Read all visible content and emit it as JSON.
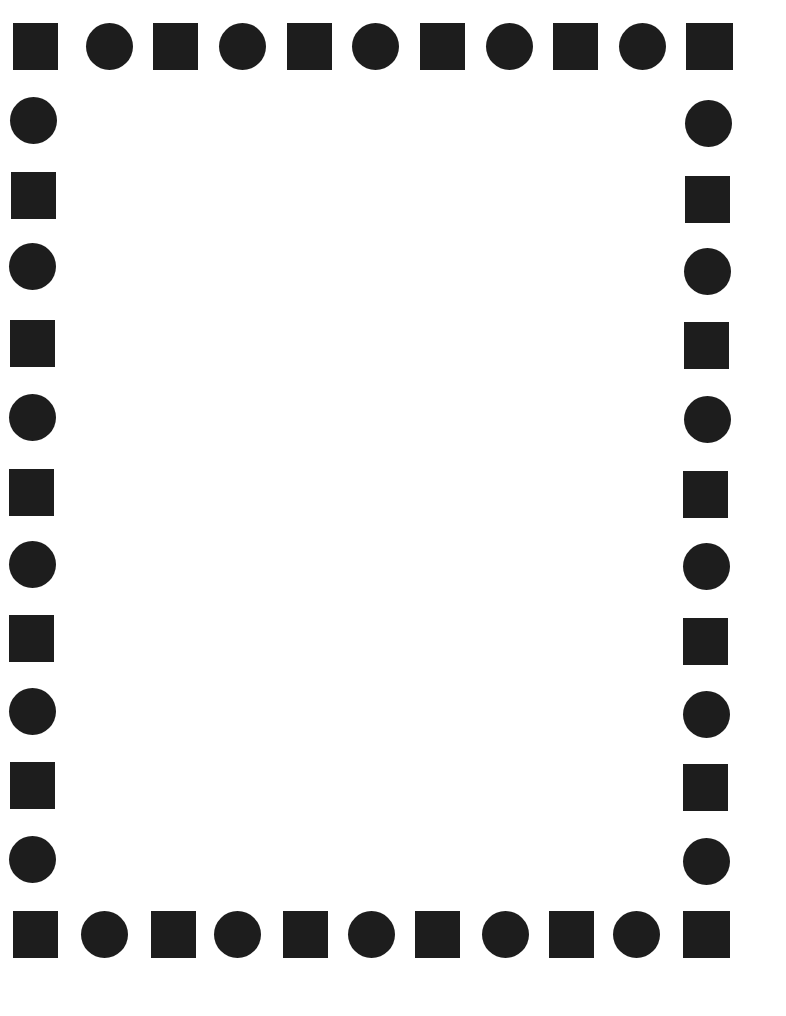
{
  "page": {
    "width": 786,
    "height": 1016,
    "background_color": "#ffffff",
    "shape_color": "#1d1d1d",
    "content_area_label": ""
  },
  "border": {
    "shape_size": 46,
    "pattern": [
      "square",
      "circle"
    ],
    "top_row": {
      "count": 11,
      "y": 23,
      "shapes": [
        {
          "type": "square",
          "x": 13,
          "y": 23,
          "w": 45,
          "h": 47
        },
        {
          "type": "circle",
          "x": 86,
          "y": 23,
          "w": 47,
          "h": 47
        },
        {
          "type": "square",
          "x": 153,
          "y": 23,
          "w": 45,
          "h": 47
        },
        {
          "type": "circle",
          "x": 219,
          "y": 23,
          "w": 47,
          "h": 47
        },
        {
          "type": "square",
          "x": 287,
          "y": 23,
          "w": 45,
          "h": 47
        },
        {
          "type": "circle",
          "x": 352,
          "y": 23,
          "w": 47,
          "h": 47
        },
        {
          "type": "square",
          "x": 420,
          "y": 23,
          "w": 45,
          "h": 47
        },
        {
          "type": "circle",
          "x": 486,
          "y": 23,
          "w": 47,
          "h": 47
        },
        {
          "type": "square",
          "x": 553,
          "y": 23,
          "w": 45,
          "h": 47
        },
        {
          "type": "circle",
          "x": 619,
          "y": 23,
          "w": 47,
          "h": 47
        },
        {
          "type": "square",
          "x": 686,
          "y": 23,
          "w": 47,
          "h": 47
        }
      ]
    },
    "bottom_row": {
      "count": 11,
      "y": 911,
      "shapes": [
        {
          "type": "square",
          "x": 13,
          "y": 911,
          "w": 45,
          "h": 47
        },
        {
          "type": "circle",
          "x": 81,
          "y": 911,
          "w": 47,
          "h": 47
        },
        {
          "type": "square",
          "x": 151,
          "y": 911,
          "w": 45,
          "h": 47
        },
        {
          "type": "circle",
          "x": 214,
          "y": 911,
          "w": 47,
          "h": 47
        },
        {
          "type": "square",
          "x": 283,
          "y": 911,
          "w": 45,
          "h": 47
        },
        {
          "type": "circle",
          "x": 348,
          "y": 911,
          "w": 47,
          "h": 47
        },
        {
          "type": "square",
          "x": 415,
          "y": 911,
          "w": 45,
          "h": 47
        },
        {
          "type": "circle",
          "x": 482,
          "y": 911,
          "w": 47,
          "h": 47
        },
        {
          "type": "square",
          "x": 549,
          "y": 911,
          "w": 45,
          "h": 47
        },
        {
          "type": "circle",
          "x": 613,
          "y": 911,
          "w": 47,
          "h": 47
        },
        {
          "type": "square",
          "x": 683,
          "y": 911,
          "w": 47,
          "h": 47
        }
      ]
    },
    "left_column": {
      "count": 13,
      "x": 13,
      "shapes": [
        {
          "type": "square",
          "x": 13,
          "y": 23,
          "w": 45,
          "h": 47
        },
        {
          "type": "circle",
          "x": 10,
          "y": 97,
          "w": 47,
          "h": 47
        },
        {
          "type": "square",
          "x": 11,
          "y": 172,
          "w": 45,
          "h": 47
        },
        {
          "type": "circle",
          "x": 9,
          "y": 243,
          "w": 47,
          "h": 47
        },
        {
          "type": "square",
          "x": 10,
          "y": 320,
          "w": 45,
          "h": 47
        },
        {
          "type": "circle",
          "x": 9,
          "y": 394,
          "w": 47,
          "h": 47
        },
        {
          "type": "square",
          "x": 9,
          "y": 469,
          "w": 45,
          "h": 47
        },
        {
          "type": "circle",
          "x": 9,
          "y": 541,
          "w": 47,
          "h": 47
        },
        {
          "type": "square",
          "x": 9,
          "y": 615,
          "w": 45,
          "h": 47
        },
        {
          "type": "circle",
          "x": 9,
          "y": 688,
          "w": 47,
          "h": 47
        },
        {
          "type": "square",
          "x": 10,
          "y": 762,
          "w": 45,
          "h": 47
        },
        {
          "type": "circle",
          "x": 9,
          "y": 836,
          "w": 47,
          "h": 47
        },
        {
          "type": "square",
          "x": 13,
          "y": 911,
          "w": 45,
          "h": 47
        }
      ]
    },
    "right_column": {
      "count": 13,
      "x": 686,
      "shapes": [
        {
          "type": "square",
          "x": 686,
          "y": 23,
          "w": 47,
          "h": 47
        },
        {
          "type": "circle",
          "x": 685,
          "y": 100,
          "w": 47,
          "h": 47
        },
        {
          "type": "square",
          "x": 685,
          "y": 176,
          "w": 45,
          "h": 47
        },
        {
          "type": "circle",
          "x": 684,
          "y": 248,
          "w": 47,
          "h": 47
        },
        {
          "type": "square",
          "x": 684,
          "y": 322,
          "w": 45,
          "h": 47
        },
        {
          "type": "circle",
          "x": 684,
          "y": 396,
          "w": 47,
          "h": 47
        },
        {
          "type": "square",
          "x": 683,
          "y": 471,
          "w": 45,
          "h": 47
        },
        {
          "type": "circle",
          "x": 683,
          "y": 543,
          "w": 47,
          "h": 47
        },
        {
          "type": "square",
          "x": 683,
          "y": 618,
          "w": 45,
          "h": 47
        },
        {
          "type": "circle",
          "x": 683,
          "y": 691,
          "w": 47,
          "h": 47
        },
        {
          "type": "square",
          "x": 683,
          "y": 764,
          "w": 45,
          "h": 47
        },
        {
          "type": "circle",
          "x": 683,
          "y": 838,
          "w": 47,
          "h": 47
        },
        {
          "type": "square",
          "x": 683,
          "y": 911,
          "w": 47,
          "h": 47
        }
      ]
    }
  },
  "content": {
    "body_text": "",
    "area": {
      "x": 70,
      "y": 80,
      "w": 610,
      "h": 825
    }
  }
}
